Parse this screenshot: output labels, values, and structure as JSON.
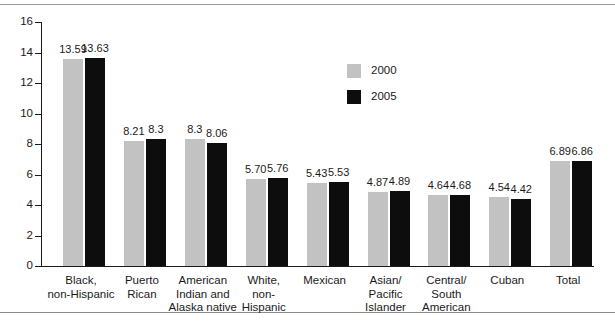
{
  "chart_data": {
    "type": "bar",
    "title": "",
    "subtitle": "",
    "xlabel": "",
    "ylabel": "",
    "ylim": [
      0,
      16
    ],
    "ytick_labels": [
      "0",
      "2",
      "4",
      "6",
      "8",
      "10",
      "12",
      "14",
      "16"
    ],
    "ytick_values": [
      0,
      2,
      4,
      6,
      8,
      10,
      12,
      14,
      16
    ],
    "grid": false,
    "legend_position": "upper-center-right",
    "categories": [
      "Black,\nnon-Hispanic",
      "Puerto\nRican",
      "American\nIndian and\nAlaska native",
      "White,\nnon-\nHispanic",
      "Mexican",
      "Asian/\nPacific\nIslander",
      "Central/\nSouth\nAmerican",
      "Cuban",
      "Total"
    ],
    "category_lines": [
      [
        "Black,",
        "non-Hispanic"
      ],
      [
        "Puerto",
        "Rican"
      ],
      [
        "American",
        "Indian and",
        "Alaska native"
      ],
      [
        "White,",
        "non-",
        "Hispanic"
      ],
      [
        "Mexican"
      ],
      [
        "Asian/",
        "Pacific",
        "Islander"
      ],
      [
        "Central/",
        "South",
        "American"
      ],
      [
        "Cuban"
      ],
      [
        "Total"
      ]
    ],
    "series": [
      {
        "name": "2000",
        "color": "#c2c2c2",
        "values": [
          13.59,
          8.21,
          8.3,
          5.7,
          5.43,
          4.87,
          4.64,
          4.54,
          6.89
        ],
        "labels": [
          "13.59",
          "8.21",
          "8.3",
          "5.70",
          "5.43",
          "4.87",
          "4.64",
          "4.54",
          "6.89"
        ]
      },
      {
        "name": "2005",
        "color": "#0d0d0d",
        "values": [
          13.63,
          8.3,
          8.06,
          5.76,
          5.53,
          4.89,
          4.68,
          4.42,
          6.86
        ],
        "labels": [
          "13.63",
          "8.3",
          "8.06",
          "5.76",
          "5.53",
          "4.89",
          "4.68",
          "4.42",
          "6.86"
        ]
      }
    ]
  },
  "legend": {
    "items": [
      {
        "label": "2000",
        "color": "#c2c2c2"
      },
      {
        "label": "2005",
        "color": "#0d0d0d"
      }
    ]
  }
}
